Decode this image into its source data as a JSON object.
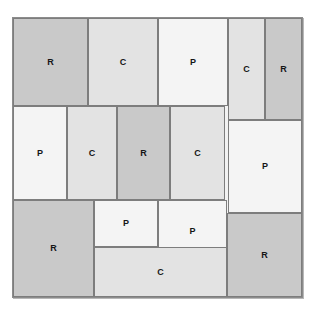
{
  "figure": {
    "background_color": "#ffffff",
    "frame": {
      "x": 12,
      "y": 17,
      "width": 291,
      "height": 281,
      "fill": "#f2f2f2",
      "border_color": "#8c8c8c"
    },
    "legend_types": {
      "R": {
        "label": "R",
        "color": "#c9c9c9"
      },
      "C": {
        "label": "C",
        "color": "#e3e3e3"
      },
      "P": {
        "label": "P",
        "color": "#f4f4f4"
      }
    },
    "blocks": [
      {
        "id": "r1-c1",
        "label": "R",
        "type": "R",
        "x": 13,
        "y": 18,
        "w": 75,
        "h": 88
      },
      {
        "id": "r1-c2",
        "label": "C",
        "type": "C",
        "x": 88,
        "y": 18,
        "w": 70,
        "h": 88
      },
      {
        "id": "r1-c3",
        "label": "P",
        "type": "P",
        "x": 158,
        "y": 18,
        "w": 70,
        "h": 88
      },
      {
        "id": "r1-c4",
        "label": "C",
        "type": "C",
        "x": 228,
        "y": 18,
        "w": 37,
        "h": 102
      },
      {
        "id": "r1-c5",
        "label": "R",
        "type": "R",
        "x": 265,
        "y": 18,
        "w": 37,
        "h": 102
      },
      {
        "id": "r2-c1",
        "label": "P",
        "type": "P",
        "x": 13,
        "y": 106,
        "w": 54,
        "h": 94
      },
      {
        "id": "r2-c2",
        "label": "C",
        "type": "C",
        "x": 67,
        "y": 106,
        "w": 50,
        "h": 94
      },
      {
        "id": "r2-c3",
        "label": "R",
        "type": "R",
        "x": 117,
        "y": 106,
        "w": 53,
        "h": 94
      },
      {
        "id": "r2-c4",
        "label": "C",
        "type": "C",
        "x": 170,
        "y": 106,
        "w": 55,
        "h": 94
      },
      {
        "id": "r2-c5",
        "label": "P",
        "type": "P",
        "x": 228,
        "y": 120,
        "w": 74,
        "h": 93
      },
      {
        "id": "r3-c1",
        "label": "R",
        "type": "R",
        "x": 13,
        "y": 200,
        "w": 81,
        "h": 97
      },
      {
        "id": "r3-c2",
        "label": "P",
        "type": "P",
        "x": 94,
        "y": 200,
        "w": 64,
        "h": 47
      },
      {
        "id": "r3-c3",
        "label": "P",
        "type": "P",
        "x": 158,
        "y": 200,
        "w": 69,
        "h": 63
      },
      {
        "id": "r3-c4",
        "label": "C",
        "type": "C",
        "x": 94,
        "y": 247,
        "w": 133,
        "h": 50
      },
      {
        "id": "r3-c5",
        "label": "R",
        "type": "R",
        "x": 227,
        "y": 213,
        "w": 75,
        "h": 84
      }
    ]
  }
}
